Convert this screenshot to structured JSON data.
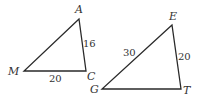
{
  "figure": {
    "type": "two similar triangles",
    "stroke_color": "#2a2a2a",
    "background": "#ffffff"
  },
  "triangle_left": {
    "vertices": [
      {
        "name": "A",
        "x": 79,
        "y": 19
      },
      {
        "name": "M",
        "x": 24,
        "y": 71
      },
      {
        "name": "C",
        "x": 86,
        "y": 71
      }
    ],
    "sides": [
      {
        "between": "A-C",
        "label": "16"
      },
      {
        "between": "M-C",
        "label": "20"
      }
    ]
  },
  "triangle_right": {
    "vertices": [
      {
        "name": "E",
        "x": 172,
        "y": 25
      },
      {
        "name": "G",
        "x": 102,
        "y": 89
      },
      {
        "name": "T",
        "x": 181,
        "y": 89
      }
    ],
    "sides": [
      {
        "between": "G-E",
        "label": "30"
      },
      {
        "between": "E-T",
        "label": "20"
      }
    ]
  }
}
